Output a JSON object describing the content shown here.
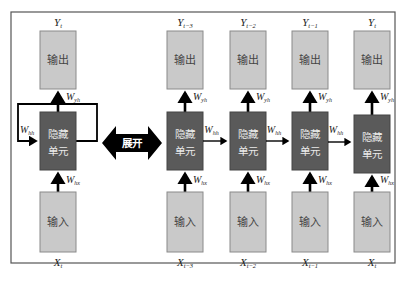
{
  "diagram": {
    "unfold_label": "展开",
    "colors": {
      "io_box": "#c9c9c9",
      "hidden_box": "#5a5a5a",
      "arrow": "#000000",
      "frame": "#555555"
    },
    "folded": {
      "output": {
        "label": "输出",
        "var": "Y",
        "sub": "t"
      },
      "hidden": {
        "label_line1": "隐藏",
        "label_line2": "单元"
      },
      "input": {
        "label": "输入",
        "var": "X",
        "sub": "t"
      },
      "w_out": {
        "base": "W",
        "sub": "yh"
      },
      "w_in": {
        "base": "W",
        "sub": "hx"
      },
      "w_rec": {
        "base": "W",
        "sub": "hh"
      }
    },
    "unrolled": [
      {
        "output_label": "输出",
        "y_var": "Y",
        "y_sub": "t−3",
        "hidden_line1": "隐藏",
        "hidden_line2": "单元",
        "input_label": "输入",
        "x_var": "X",
        "x_sub": "t−3",
        "w_out": "yh",
        "w_in": "hx"
      },
      {
        "output_label": "输出",
        "y_var": "Y",
        "y_sub": "t−2",
        "hidden_line1": "隐藏",
        "hidden_line2": "单元",
        "input_label": "输入",
        "x_var": "X",
        "x_sub": "t−2",
        "w_out": "yh",
        "w_in": "hx"
      },
      {
        "output_label": "输出",
        "y_var": "Y",
        "y_sub": "t−1",
        "hidden_line1": "隐藏",
        "hidden_line2": "单元",
        "input_label": "输入",
        "x_var": "X",
        "x_sub": "t−1",
        "w_out": "yh",
        "w_in": "hx"
      },
      {
        "output_label": "输出",
        "y_var": "Y",
        "y_sub": "t",
        "hidden_line1": "隐藏",
        "hidden_line2": "单元",
        "input_label": "输入",
        "x_var": "X",
        "x_sub": "t",
        "w_out": "yh",
        "w_in": "hx"
      }
    ],
    "recurrent_links": [
      {
        "base": "W",
        "sub": "hh"
      },
      {
        "base": "W",
        "sub": "hh"
      },
      {
        "base": "W",
        "sub": "hh"
      }
    ],
    "weight_base": "W"
  }
}
